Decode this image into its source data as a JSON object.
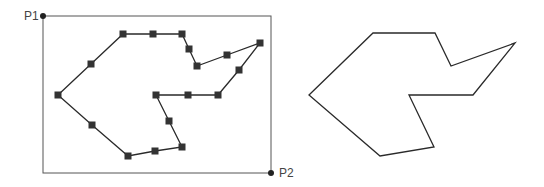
{
  "labels": {
    "p1": "P1",
    "p2": "P2"
  },
  "colors": {
    "line": "#2a2a2a",
    "marker": "#333333",
    "border": "#555555",
    "label": "#444444"
  },
  "bounding_box": {
    "p1": [
      43,
      16
    ],
    "p2": [
      271,
      173
    ]
  },
  "left_polygon": {
    "description": "polygon with square markers at control points",
    "points": [
      [
        58,
        95
      ],
      [
        91,
        64
      ],
      [
        123,
        34
      ],
      [
        153,
        34
      ],
      [
        182,
        34
      ],
      [
        189,
        49
      ],
      [
        197,
        66
      ],
      [
        227,
        55
      ],
      [
        260,
        43
      ],
      [
        239,
        70
      ],
      [
        218,
        95
      ],
      [
        188,
        95
      ],
      [
        156,
        95
      ],
      [
        169,
        121
      ],
      [
        182,
        147
      ],
      [
        155,
        151
      ],
      [
        128,
        156
      ],
      [
        92,
        125
      ]
    ]
  },
  "right_polygon": {
    "description": "simplified polygon outline",
    "points": [
      [
        309,
        95
      ],
      [
        373,
        33
      ],
      [
        435,
        33
      ],
      [
        451,
        66
      ],
      [
        515,
        43
      ],
      [
        473,
        95
      ],
      [
        409,
        95
      ],
      [
        434,
        147
      ],
      [
        380,
        156
      ]
    ]
  }
}
